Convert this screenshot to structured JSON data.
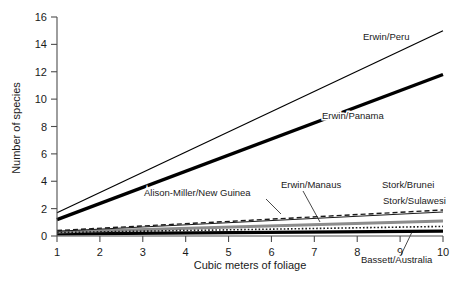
{
  "chart_data": {
    "type": "line",
    "title": "",
    "subtitle": "",
    "xlabel": "Cubic meters of foliage",
    "ylabel": "Number of species",
    "xlim": [
      1,
      10
    ],
    "ylim": [
      0,
      16
    ],
    "xticks": [
      "1",
      "2",
      "3",
      "4",
      "5",
      "6",
      "7",
      "8",
      "9",
      "10"
    ],
    "yticks": [
      "0",
      "2",
      "4",
      "6",
      "8",
      "10",
      "12",
      "14",
      "16"
    ],
    "grid": false,
    "legend_position": "inline-annotations",
    "x": [
      1,
      10
    ],
    "series": [
      {
        "name": "Erwin/Peru",
        "values": [
          1.7,
          15.0
        ],
        "style": "solid",
        "width": 1.2,
        "color": "#000000",
        "label_x": 363,
        "label_y": 40,
        "label_anchor": "start",
        "leader": null
      },
      {
        "name": "Erwin/Panama",
        "values": [
          1.2,
          11.8
        ],
        "style": "solid",
        "width": 3.4,
        "color": "#000000",
        "label_x": 322,
        "label_y": 119,
        "label_anchor": "start",
        "leader": null
      },
      {
        "name": "Alison-Miller/New Guinea",
        "values": [
          0.4,
          1.9
        ],
        "style": "dashed",
        "width": 1.4,
        "color": "#1a1a1a",
        "label_x": 144,
        "label_y": 196,
        "label_anchor": "start",
        "leader": [
          266,
          199,
          281,
          214
        ]
      },
      {
        "name": "Stork/Brunei",
        "values": [
          0.35,
          1.75
        ],
        "style": "solid",
        "width": 1.1,
        "color": "#1a1a1a",
        "label_x": 382,
        "label_y": 188,
        "label_anchor": "start",
        "leader": null
      },
      {
        "name": "Stork/Sulawesi",
        "values": [
          0.3,
          1.1
        ],
        "style": "solid",
        "width": 3.0,
        "color": "#8c8c8c",
        "label_x": 383,
        "label_y": 204,
        "label_anchor": "start",
        "leader": null
      },
      {
        "name": "Erwin/Manaus",
        "values": [
          0.25,
          0.7
        ],
        "style": "dotted",
        "width": 1.6,
        "color": "#1a1a1a",
        "label_x": 281,
        "label_y": 188,
        "label_anchor": "start",
        "leader": [
          303,
          191,
          320,
          222
        ]
      },
      {
        "name": "Bassett/Australia",
        "values": [
          0.15,
          0.35
        ],
        "style": "solid",
        "width": 3.2,
        "color": "#000000",
        "label_x": 361,
        "label_y": 263,
        "label_anchor": "start",
        "leader": [
          401,
          255,
          412,
          232
        ]
      }
    ]
  }
}
